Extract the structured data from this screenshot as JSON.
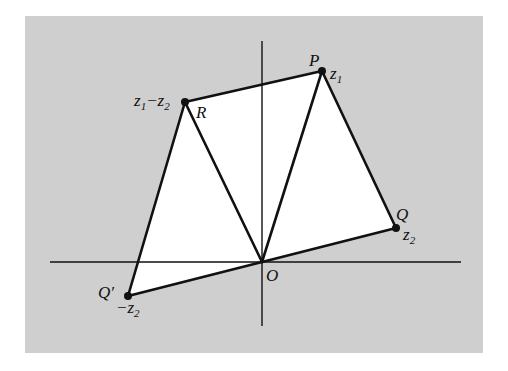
{
  "figure": {
    "colors": {
      "background_panel": "#cfcfcf",
      "region_fill": "#ffffff",
      "stroke": "#111111",
      "page": "#ffffff"
    }
  },
  "points": {
    "O": {
      "name": "O",
      "value": "",
      "sub": "",
      "coords": [
        0,
        0
      ]
    },
    "P": {
      "name": "P",
      "value": "z",
      "sub": "1",
      "coords": [
        60,
        191
      ]
    },
    "Q": {
      "name": "Q",
      "value": "z",
      "sub": "2",
      "coords": [
        134,
        34
      ]
    },
    "Qp": {
      "name": "Q′",
      "value": "−z",
      "sub": "2",
      "coords": [
        -134,
        -34
      ]
    },
    "R": {
      "name": "R",
      "value": "z₁−z₂",
      "coords": [
        -77,
        160
      ],
      "value_parts": {
        "a": "z",
        "a_sub": "1",
        "op": "−",
        "b": "z",
        "b_sub": "2"
      }
    }
  },
  "segments": [
    [
      "O",
      "P"
    ],
    [
      "O",
      "Q"
    ],
    [
      "P",
      "Q"
    ],
    [
      "O",
      "R"
    ],
    [
      "P",
      "R"
    ],
    [
      "O",
      "Qp"
    ],
    [
      "R",
      "Qp"
    ]
  ],
  "regions": [
    [
      "O",
      "Q",
      "P",
      "R",
      "Qp"
    ]
  ],
  "axes": {
    "x_range": [
      -212,
      199
    ],
    "y_range": [
      -64,
      221
    ]
  }
}
